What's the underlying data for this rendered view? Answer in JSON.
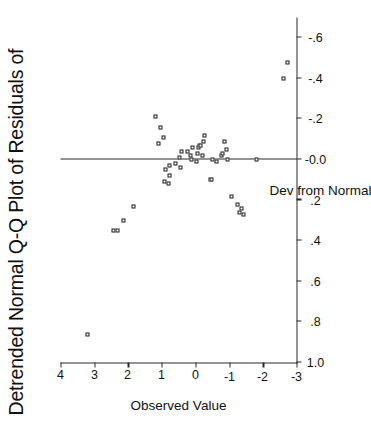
{
  "figure": {
    "title": "Detrended Normal Q-Q Plot of Residuals of",
    "background_color": "#ffffff",
    "ink_color": "#1a1a1a",
    "rotation_note": "90"
  },
  "chart_data": {
    "type": "scatter",
    "title": "Detrended Normal Q-Q Plot of Residuals of",
    "xlabel": "Dev from Normal",
    "ylabel": "Observed Value",
    "xlim": [
      -0.7,
      1.0
    ],
    "ylim": [
      -3,
      4
    ],
    "xticks": [
      1.0,
      0.8,
      0.6,
      0.4,
      0.2,
      0.0,
      -0.2,
      -0.4,
      -0.6
    ],
    "xtick_labels": [
      "1.0",
      ".8",
      ".6",
      ".4",
      ".2",
      "-0.0",
      "-.2",
      "-.4",
      "-.6"
    ],
    "yticks": [
      4,
      3,
      2,
      1,
      0,
      -1,
      -2,
      -3
    ],
    "ytick_labels": [
      "4",
      "3",
      "2",
      "1",
      "0",
      "-1",
      "-2",
      "-3"
    ],
    "grid": false,
    "legend": "none",
    "reference_line": {
      "orientation": "vertical",
      "value": 0.0
    },
    "marker": "open-square",
    "points": [
      {
        "x": 0.86,
        "y": 3.2
      },
      {
        "x": 0.35,
        "y": 2.42
      },
      {
        "x": 0.35,
        "y": 2.3
      },
      {
        "x": 0.3,
        "y": 2.12
      },
      {
        "x": 0.23,
        "y": 1.82
      },
      {
        "x": -0.21,
        "y": 1.18
      },
      {
        "x": -0.16,
        "y": 1.02
      },
      {
        "x": -0.08,
        "y": 1.08
      },
      {
        "x": -0.11,
        "y": 0.95
      },
      {
        "x": 0.11,
        "y": 0.92
      },
      {
        "x": 0.05,
        "y": 0.88
      },
      {
        "x": 0.12,
        "y": 0.8
      },
      {
        "x": 0.08,
        "y": 0.78
      },
      {
        "x": 0.03,
        "y": 0.77
      },
      {
        "x": 0.02,
        "y": 0.6
      },
      {
        "x": -0.01,
        "y": 0.47
      },
      {
        "x": 0.04,
        "y": 0.44
      },
      {
        "x": -0.04,
        "y": 0.42
      },
      {
        "x": -0.04,
        "y": 0.23
      },
      {
        "x": -0.02,
        "y": 0.14
      },
      {
        "x": 0.0,
        "y": 0.1
      },
      {
        "x": -0.06,
        "y": 0.08
      },
      {
        "x": 0.01,
        "y": -0.02
      },
      {
        "x": -0.03,
        "y": -0.05
      },
      {
        "x": -0.06,
        "y": -0.1
      },
      {
        "x": -0.07,
        "y": -0.12
      },
      {
        "x": -0.07,
        "y": -0.14
      },
      {
        "x": -0.02,
        "y": -0.2
      },
      {
        "x": -0.09,
        "y": -0.24
      },
      {
        "x": -0.12,
        "y": -0.26
      },
      {
        "x": 0.1,
        "y": -0.45
      },
      {
        "x": 0.1,
        "y": -0.48
      },
      {
        "x": 0.0,
        "y": -0.5
      },
      {
        "x": 0.01,
        "y": -0.62
      },
      {
        "x": -0.02,
        "y": -0.78
      },
      {
        "x": -0.03,
        "y": -0.8
      },
      {
        "x": -0.09,
        "y": -0.86
      },
      {
        "x": -0.05,
        "y": -0.92
      },
      {
        "x": 0.0,
        "y": -0.96
      },
      {
        "x": 0.18,
        "y": -1.06
      },
      {
        "x": 0.22,
        "y": -1.26
      },
      {
        "x": 0.26,
        "y": -1.3
      },
      {
        "x": 0.24,
        "y": -1.36
      },
      {
        "x": 0.27,
        "y": -1.42
      },
      {
        "x": 0.0,
        "y": -1.82
      },
      {
        "x": -0.4,
        "y": -2.62
      },
      {
        "x": -0.48,
        "y": -2.74
      }
    ]
  }
}
